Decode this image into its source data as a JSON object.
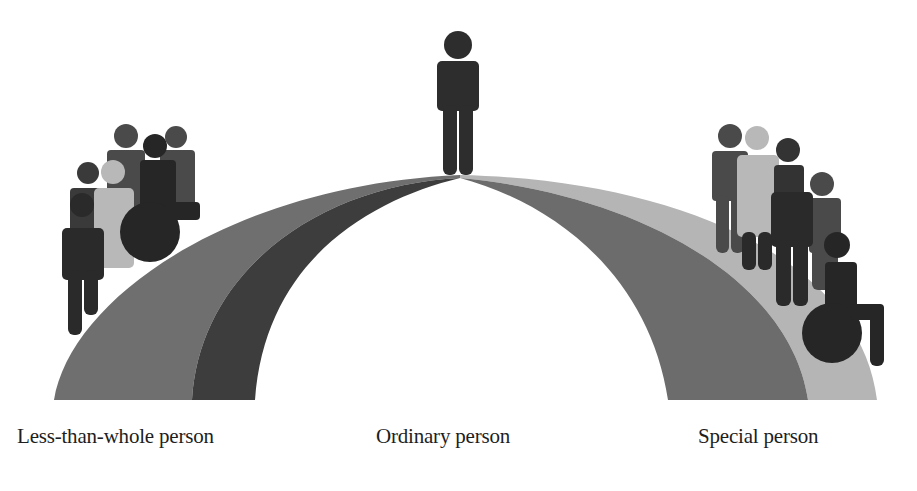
{
  "diagram": {
    "type": "continuum-arch",
    "colors": {
      "background": "#ffffff",
      "left_outer_band": "#6f6f6f",
      "left_inner_band": "#3d3d3d",
      "right_inner_band": "#6c6c6c",
      "right_outer_band": "#b5b5b5",
      "figure_dark": "#2a2a2a",
      "figure_medium": "#4a4a4a",
      "figure_light": "#b8b8b8"
    },
    "labels": [
      {
        "id": "left",
        "text": "Less-than-whole person"
      },
      {
        "id": "center",
        "text": "Ordinary person"
      },
      {
        "id": "right",
        "text": "Special person"
      }
    ],
    "groups": {
      "left": {
        "figure_count": 6,
        "includes_wheelchair_user": true
      },
      "center": {
        "figure_count": 1,
        "includes_wheelchair_user": false
      },
      "right": {
        "figure_count": 6,
        "includes_wheelchair_user": true
      }
    }
  }
}
